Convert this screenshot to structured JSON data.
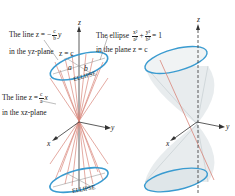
{
  "figure": {
    "left_panel": {
      "label_line_yz": {
        "prefix": "The line z = −",
        "frac_num": "c",
        "frac_den": "b",
        "suffix": "y",
        "second_line": "in the yz-plane"
      },
      "label_plane": "z = c",
      "label_ellipse_eq": {
        "prefix": "The ellipse",
        "t1_num": "x²",
        "t1_den": "a²",
        "plus": "+",
        "t2_num": "y²",
        "t2_den": "b²",
        "suffix": "= 1",
        "second_line": "in the plane z = c"
      },
      "label_line_xz": {
        "prefix": "The line z =",
        "frac_num": "c",
        "frac_den": "a",
        "suffix": "x",
        "second_line": "in the xz-plane"
      },
      "semi_axis_a": "a",
      "semi_axis_b": "b",
      "ellipse_top_label": "ELLIPSE",
      "ellipse_bottom_label": "ELLIPSE",
      "axis_z": "z",
      "axis_x": "x",
      "axis_y": "y"
    },
    "right_panel": {
      "axis_z": "z",
      "axis_x": "x",
      "axis_y": "y"
    },
    "colors": {
      "ellipse": "#3a9bd0",
      "generator_lines": "#d9857a",
      "axes": "#222222",
      "cone_fill": "#e6eaec"
    }
  }
}
